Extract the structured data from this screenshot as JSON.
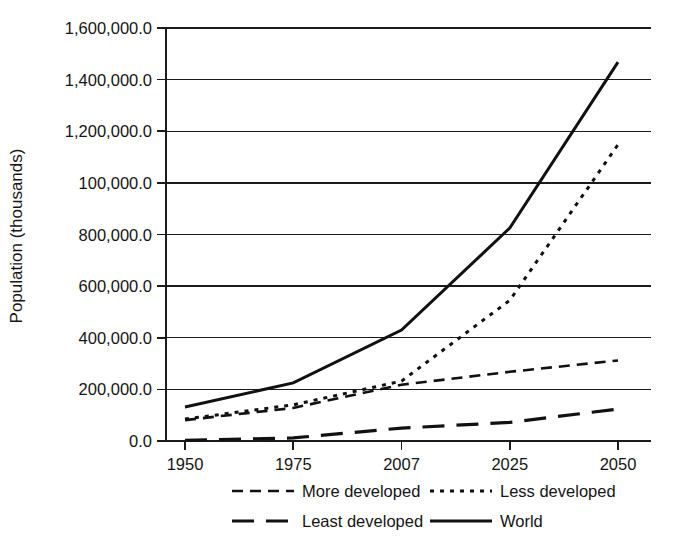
{
  "figure": {
    "background_color": "#ffffff",
    "line_color": "#111111"
  },
  "chart_data": {
    "type": "line",
    "title": "",
    "subtitle": "",
    "xlabel": "",
    "ylabel": "Population (thousands)",
    "categories": [
      "1950",
      "1975",
      "2007",
      "2025",
      "2050"
    ],
    "x": [
      1950,
      1975,
      2007,
      2025,
      2050
    ],
    "xtick_labels": [
      "1950",
      "1975",
      "2007",
      "2025",
      "2050"
    ],
    "ytick_labels": [
      "0.0",
      "200,000.0",
      "400,000.0",
      "600,000.0",
      "800,000.0",
      "100,000.0",
      "1,200,000.0",
      "1,400,000.0",
      "1,600,000.0"
    ],
    "ytick_values": [
      0,
      200000,
      400000,
      600000,
      800000,
      1000000,
      1200000,
      1400000,
      1600000
    ],
    "ylim": [
      0,
      1600000
    ],
    "grid": "horizontal",
    "legend_position": "bottom",
    "series": [
      {
        "name": "More developed",
        "dash": "dashed",
        "stroke_width": 2.6,
        "dash_array": "11,7",
        "values": [
          81000,
          128000,
          218000,
          268000,
          312000
        ]
      },
      {
        "name": "Less developed",
        "dash": "dotted",
        "stroke_width": 3.0,
        "dash_array": "4,6",
        "values": [
          85000,
          140000,
          232000,
          545000,
          1148000
        ]
      },
      {
        "name": "Least developed",
        "dash": "long-dashed",
        "stroke_width": 3.2,
        "dash_array": "22,12",
        "values": [
          3000,
          12000,
          50000,
          72000,
          124000
        ]
      },
      {
        "name": "World",
        "dash": "solid",
        "stroke_width": 3.0,
        "dash_array": "none",
        "values": [
          132000,
          225000,
          430000,
          825000,
          1468000
        ]
      }
    ]
  },
  "legend": {
    "entries": [
      {
        "label": "More developed",
        "dash_array": "11,7",
        "stroke_width": 2.6
      },
      {
        "label": "Less developed",
        "dash_array": "4,6",
        "stroke_width": 3.0
      },
      {
        "label": "Least developed",
        "dash_array": "22,12",
        "stroke_width": 3.2
      },
      {
        "label": "World",
        "dash_array": "none",
        "stroke_width": 3.0
      }
    ]
  }
}
